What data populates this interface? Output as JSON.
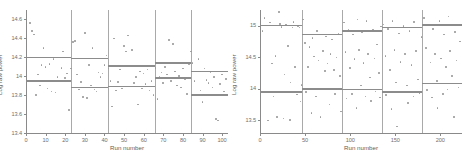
{
  "figure": {
    "background": "#ffffff",
    "point_color": "#9a9a9a",
    "level_color": "#8c8c8c",
    "divider_color": "#a9a9a9",
    "axis_color": "#8a8a8a"
  },
  "panels": [
    {
      "id": "left",
      "name": "panel-left"
    },
    {
      "id": "right",
      "name": "panel-right"
    }
  ],
  "chart_data": [
    {
      "type": "scatter",
      "panel": "left",
      "title": "",
      "xlabel": "Run number",
      "ylabel": "Log raw power",
      "xlim": [
        0,
        103
      ],
      "ylim": [
        13.4,
        14.7
      ],
      "xticks": [
        0,
        10,
        20,
        30,
        40,
        50,
        60,
        70,
        80,
        90,
        100
      ],
      "xticklabels": [
        "0",
        "10",
        "20",
        "30",
        "40",
        "50",
        "60",
        "70",
        "80",
        "90",
        "100"
      ],
      "yticks": [
        13.4,
        13.6,
        13.8,
        14.0,
        14.2,
        14.4,
        14.6
      ],
      "yticklabels": [
        "13.4",
        "13.6",
        "13.8",
        "14",
        "14.2",
        "14.4",
        "14.6"
      ],
      "grid": false,
      "legend": "none",
      "segment_boundaries": [
        23,
        42,
        66,
        84
      ],
      "segments": [
        {
          "x_start": 0,
          "x_end": 23,
          "upper_level": 14.2,
          "lower_level": 13.95
        },
        {
          "x_start": 23,
          "x_end": 42,
          "upper_level": 14.19,
          "lower_level": 13.88
        },
        {
          "x_start": 42,
          "x_end": 66,
          "upper_level": 14.11,
          "lower_level": 13.89
        },
        {
          "x_start": 66,
          "x_end": 84,
          "upper_level": 14.14,
          "lower_level": 13.98
        },
        {
          "x_start": 84,
          "x_end": 103,
          "upper_level": 14.05,
          "lower_level": 13.8
        }
      ],
      "points": [
        [
          2,
          14.56
        ],
        [
          3,
          14.48
        ],
        [
          4,
          14.44
        ],
        [
          5,
          13.8
        ],
        [
          6,
          14.02
        ],
        [
          7,
          13.9
        ],
        [
          8,
          14.12
        ],
        [
          9,
          14.3
        ],
        [
          10,
          14.1
        ],
        [
          11,
          13.87
        ],
        [
          12,
          14.13
        ],
        [
          13,
          13.84
        ],
        [
          14,
          14.18
        ],
        [
          15,
          13.83
        ],
        [
          16,
          13.99
        ],
        [
          17,
          13.95
        ],
        [
          18,
          14.09
        ],
        [
          19,
          14.26
        ],
        [
          20,
          13.98
        ],
        [
          21,
          14.03
        ],
        [
          22,
          13.64
        ],
        [
          23,
          14.08
        ],
        [
          24,
          14.36
        ],
        [
          25,
          14.37
        ],
        [
          26,
          14.02
        ],
        [
          27,
          13.86
        ],
        [
          28,
          13.94
        ],
        [
          29,
          13.78
        ],
        [
          30,
          14.46
        ],
        [
          31,
          13.77
        ],
        [
          32,
          14.12
        ],
        [
          33,
          13.9
        ],
        [
          34,
          14.3
        ],
        [
          35,
          13.86
        ],
        [
          36,
          13.84
        ],
        [
          37,
          14.04
        ],
        [
          38,
          13.99
        ],
        [
          39,
          14.03
        ],
        [
          40,
          14.12
        ],
        [
          41,
          14.22
        ],
        [
          42,
          14.08
        ],
        [
          43,
          13.95
        ],
        [
          44,
          13.68
        ],
        [
          45,
          14.4
        ],
        [
          46,
          13.85
        ],
        [
          47,
          13.94
        ],
        [
          48,
          14.07
        ],
        [
          49,
          13.87
        ],
        [
          50,
          14.32
        ],
        [
          51,
          14.26
        ],
        [
          52,
          14.43
        ],
        [
          53,
          13.89
        ],
        [
          54,
          14.28
        ],
        [
          55,
          13.93
        ],
        [
          56,
          13.99
        ],
        [
          57,
          13.7
        ],
        [
          58,
          14.05
        ],
        [
          59,
          13.87
        ],
        [
          60,
          14.03
        ],
        [
          61,
          13.92
        ],
        [
          62,
          14.07
        ],
        [
          63,
          13.85
        ],
        [
          64,
          13.95
        ],
        [
          65,
          13.8
        ],
        [
          66,
          14.09
        ],
        [
          67,
          13.76
        ],
        [
          68,
          13.99
        ],
        [
          69,
          14.04
        ],
        [
          70,
          13.93
        ],
        [
          71,
          14.1
        ],
        [
          72,
          14.02
        ],
        [
          73,
          14.38
        ],
        [
          74,
          13.95
        ],
        [
          75,
          14.34
        ],
        [
          76,
          14.05
        ],
        [
          77,
          13.9
        ],
        [
          78,
          14.0
        ],
        [
          79,
          13.88
        ],
        [
          80,
          14.08
        ],
        [
          81,
          13.97
        ],
        [
          82,
          13.81
        ],
        [
          83,
          14.13
        ],
        [
          84,
          14.26
        ],
        [
          85,
          14.14
        ],
        [
          86,
          13.95
        ],
        [
          87,
          14.05
        ],
        [
          88,
          14.18
        ],
        [
          89,
          13.85
        ],
        [
          90,
          13.73
        ],
        [
          91,
          14.08
        ],
        [
          92,
          13.96
        ],
        [
          93,
          13.93
        ],
        [
          94,
          14.04
        ],
        [
          95,
          13.88
        ],
        [
          96,
          13.99
        ],
        [
          97,
          13.55
        ],
        [
          98,
          13.53
        ],
        [
          99,
          13.92
        ],
        [
          100,
          14.02
        ],
        [
          101,
          13.84
        ],
        [
          102,
          13.97
        ]
      ]
    },
    {
      "type": "scatter",
      "panel": "right",
      "title": "",
      "xlabel": "Run number",
      "ylabel": "Log raw power",
      "xlim": [
        0,
        224
      ],
      "ylim": [
        13.3,
        15.25
      ],
      "xticks": [
        0,
        50,
        100,
        150,
        200
      ],
      "xticklabels": [
        "0",
        "50",
        "100",
        "150",
        "200"
      ],
      "yticks": [
        13.5,
        14.0,
        14.5,
        15.0
      ],
      "yticklabels": [
        "13.5",
        "14",
        "14.5",
        "15"
      ],
      "grid": false,
      "legend": "none",
      "segment_boundaries": [
        47,
        91,
        135,
        180
      ],
      "segments": [
        {
          "x_start": 0,
          "x_end": 47,
          "upper_level": 15.0,
          "lower_level": 13.95
        },
        {
          "x_start": 47,
          "x_end": 91,
          "upper_level": 14.86,
          "lower_level": 14.0
        },
        {
          "x_start": 91,
          "x_end": 135,
          "upper_level": 14.92,
          "lower_level": 13.99
        },
        {
          "x_start": 135,
          "x_end": 180,
          "upper_level": 14.97,
          "lower_level": 13.95
        },
        {
          "x_start": 180,
          "x_end": 224,
          "upper_level": 15.01,
          "lower_level": 14.08
        }
      ],
      "points": [
        [
          3,
          14.92
        ],
        [
          5,
          15.12
        ],
        [
          7,
          13.96
        ],
        [
          9,
          13.5
        ],
        [
          11,
          15.05
        ],
        [
          13,
          14.4
        ],
        [
          15,
          13.88
        ],
        [
          17,
          14.52
        ],
        [
          19,
          13.55
        ],
        [
          21,
          15.22
        ],
        [
          22,
          15.03
        ],
        [
          24,
          14.98
        ],
        [
          26,
          13.53
        ],
        [
          27,
          14.23
        ],
        [
          29,
          15.02
        ],
        [
          31,
          14.68
        ],
        [
          33,
          13.51
        ],
        [
          34,
          14.1
        ],
        [
          36,
          14.97
        ],
        [
          37,
          15.06
        ],
        [
          39,
          14.35
        ],
        [
          41,
          13.91
        ],
        [
          42,
          15.0
        ],
        [
          44,
          14.97
        ],
        [
          45,
          13.8
        ],
        [
          46,
          14.06
        ],
        [
          48,
          15.1
        ],
        [
          50,
          14.73
        ],
        [
          51,
          13.95
        ],
        [
          53,
          14.35
        ],
        [
          55,
          14.66
        ],
        [
          57,
          13.62
        ],
        [
          58,
          14.81
        ],
        [
          60,
          14.51
        ],
        [
          62,
          13.88
        ],
        [
          63,
          14.92
        ],
        [
          65,
          14.45
        ],
        [
          67,
          13.55
        ],
        [
          68,
          14.86
        ],
        [
          70,
          14.6
        ],
        [
          72,
          14.28
        ],
        [
          73,
          14.83
        ],
        [
          75,
          14.4
        ],
        [
          77,
          13.75
        ],
        [
          78,
          14.55
        ],
        [
          80,
          14.78
        ],
        [
          82,
          14.3
        ],
        [
          83,
          13.92
        ],
        [
          85,
          14.5
        ],
        [
          87,
          14.88
        ],
        [
          89,
          14.2
        ],
        [
          90,
          13.64
        ],
        [
          93,
          15.05
        ],
        [
          95,
          14.58
        ],
        [
          96,
          13.85
        ],
        [
          98,
          14.94
        ],
        [
          100,
          14.33
        ],
        [
          102,
          13.92
        ],
        [
          103,
          14.86
        ],
        [
          105,
          14.47
        ],
        [
          107,
          13.7
        ],
        [
          108,
          15.1
        ],
        [
          110,
          14.62
        ],
        [
          112,
          14.05
        ],
        [
          113,
          14.9
        ],
        [
          115,
          14.41
        ],
        [
          117,
          13.88
        ],
        [
          118,
          15.08
        ],
        [
          120,
          14.55
        ],
        [
          122,
          14.18
        ],
        [
          123,
          13.81
        ],
        [
          125,
          14.93
        ],
        [
          127,
          14.48
        ],
        [
          128,
          13.96
        ],
        [
          130,
          14.7
        ],
        [
          132,
          14.25
        ],
        [
          133,
          13.86
        ],
        [
          134,
          14.99
        ],
        [
          137,
          15.02
        ],
        [
          139,
          14.52
        ],
        [
          140,
          13.9
        ],
        [
          142,
          14.95
        ],
        [
          144,
          14.3
        ],
        [
          146,
          13.68
        ],
        [
          147,
          15.08
        ],
        [
          149,
          14.62
        ],
        [
          151,
          14.1
        ],
        [
          152,
          13.4
        ],
        [
          154,
          14.88
        ],
        [
          156,
          14.43
        ],
        [
          158,
          13.95
        ],
        [
          159,
          15.0
        ],
        [
          161,
          14.55
        ],
        [
          163,
          14.05
        ],
        [
          164,
          13.78
        ],
        [
          166,
          14.92
        ],
        [
          168,
          14.38
        ],
        [
          170,
          13.88
        ],
        [
          171,
          15.06
        ],
        [
          173,
          14.6
        ],
        [
          175,
          14.15
        ],
        [
          177,
          13.93
        ],
        [
          179,
          14.82
        ],
        [
          182,
          15.12
        ],
        [
          184,
          14.65
        ],
        [
          185,
          13.98
        ],
        [
          187,
          15.02
        ],
        [
          189,
          14.42
        ],
        [
          191,
          13.86
        ],
        [
          192,
          14.95
        ],
        [
          194,
          14.55
        ],
        [
          196,
          14.12
        ],
        [
          197,
          13.7
        ],
        [
          199,
          15.08
        ],
        [
          201,
          14.48
        ],
        [
          203,
          13.92
        ],
        [
          204,
          14.86
        ],
        [
          206,
          14.35
        ],
        [
          208,
          13.99
        ],
        [
          209,
          15.15
        ],
        [
          211,
          14.6
        ],
        [
          213,
          14.2
        ],
        [
          215,
          13.55
        ],
        [
          216,
          14.9
        ],
        [
          218,
          14.45
        ],
        [
          220,
          14.02
        ],
        [
          222,
          14.75
        ]
      ]
    }
  ]
}
